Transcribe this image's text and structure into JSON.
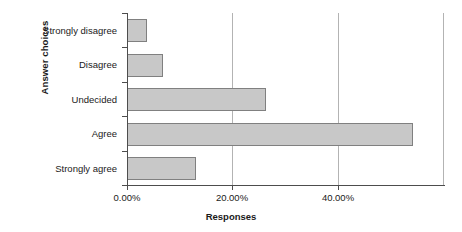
{
  "chart_data": {
    "type": "bar",
    "orientation": "horizontal",
    "title": "",
    "xlabel": "Responses",
    "ylabel": "Answer choices",
    "categories": [
      "Strongly disagree",
      "Disagree",
      "Undecided",
      "Agree",
      "Strongly agree"
    ],
    "values": [
      3.8,
      6.8,
      26.4,
      54.3,
      13.1
    ],
    "value_labels": [
      "3.80%",
      "6.80%",
      "26.40%",
      "54.30%",
      "13.10%"
    ],
    "xlim": [
      0,
      60.1
    ],
    "xticks": [
      0,
      20,
      40
    ],
    "xtick_labels": [
      "0.00%",
      "20.00%",
      "40.00%"
    ],
    "grid": true,
    "grid_axis": "x",
    "legend": false,
    "bar_fill_color": "#c8c8c8",
    "bar_border_color": "#808080",
    "axis_color": "#4d4d4d",
    "grid_color": "#b3b3b3",
    "background_color": "#ffffff"
  }
}
